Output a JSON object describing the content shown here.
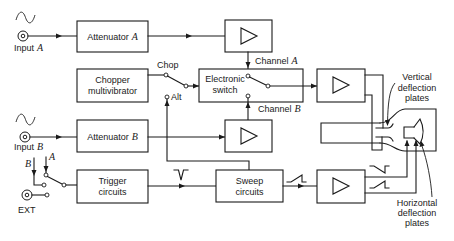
{
  "inputs": {
    "input_a": {
      "label": "Input",
      "channel": "A",
      "waveform_icon": "sine-wave"
    },
    "input_b": {
      "label": "Input",
      "channel": "B",
      "waveform_icon": "sine-wave"
    },
    "ext": {
      "label": "EXT"
    }
  },
  "blocks": {
    "attenuator_a": {
      "label": "Attenuator",
      "channel": "A"
    },
    "attenuator_b": {
      "label": "Attenuator",
      "channel": "B"
    },
    "chopper": {
      "lines": [
        "Chopper",
        "multivibrator"
      ]
    },
    "electronic_switch": {
      "lines": [
        "Electronic",
        "switch"
      ]
    },
    "trigger": {
      "lines": [
        "Trigger",
        "circuits"
      ]
    },
    "sweep": {
      "lines": [
        "Sweep",
        "circuits"
      ]
    },
    "amplifiers": [
      {
        "id": "channel-a-amplifier",
        "icon": "amplifier-triangle"
      },
      {
        "id": "channel-b-amplifier",
        "icon": "amplifier-triangle"
      },
      {
        "id": "vertical-amplifier",
        "icon": "amplifier-triangle"
      },
      {
        "id": "horizontal-amplifier",
        "icon": "amplifier-triangle"
      }
    ]
  },
  "switch_labels": {
    "chop": "Chop",
    "alt": "Alt",
    "channel_a": {
      "label": "Channel",
      "channel": "A"
    },
    "channel_b": {
      "label": "Channel",
      "channel": "B"
    }
  },
  "trigger_source": {
    "a": "A",
    "b": "B"
  },
  "crt": {
    "vertical_plates": [
      "Vertical",
      "deflection",
      "plates"
    ],
    "horizontal_plates": [
      "Horizontal",
      "deflection",
      "plates"
    ]
  },
  "waveform_symbols": {
    "trigger_output": "trigger-pulse",
    "sweep_output": "sawtooth",
    "horizontal_upper": "inverted-sawtooth",
    "horizontal_lower": "sawtooth"
  },
  "colors": {
    "stroke": "#1a1a1a",
    "background": "#ffffff"
  }
}
